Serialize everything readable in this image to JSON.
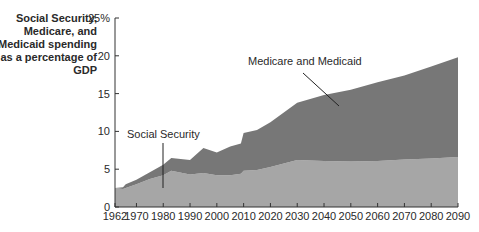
{
  "chart_data": {
    "type": "area",
    "stacked": true,
    "title": "",
    "ylabel": "Social Security, Medicare, and Medicaid spending as a percentage of GDP",
    "xlabel": "",
    "ylim": [
      0,
      25
    ],
    "xlim": [
      1962,
      2090
    ],
    "y_ticks": [
      "0",
      "5",
      "10",
      "15",
      "20",
      "25%"
    ],
    "x_ticks": [
      "1962",
      "1970",
      "1980",
      "1990",
      "2000",
      "2010",
      "2020",
      "2030",
      "2040",
      "2050",
      "2060",
      "2070",
      "2080",
      "2090"
    ],
    "grid": false,
    "legend": "none (direct annotations)",
    "x": [
      1962,
      1965,
      1966,
      1970,
      1975,
      1980,
      1983,
      1990,
      1995,
      2000,
      2005,
      2009,
      2010,
      2015,
      2020,
      2030,
      2040,
      2050,
      2060,
      2070,
      2080,
      2090
    ],
    "series": [
      {
        "name": "Social Security",
        "color": "#a6a6a6",
        "values": [
          2.5,
          2.4,
          2.5,
          3.0,
          3.7,
          4.2,
          4.8,
          4.3,
          4.5,
          4.2,
          4.2,
          4.4,
          4.8,
          4.9,
          5.3,
          6.2,
          6.1,
          6.0,
          6.1,
          6.3,
          6.4,
          6.6
        ]
      },
      {
        "name": "Medicare and Medicaid",
        "color": "#777777",
        "values": [
          0.0,
          0.2,
          0.5,
          0.6,
          0.9,
          1.4,
          1.7,
          1.9,
          3.3,
          3.0,
          3.8,
          4.0,
          5.0,
          5.3,
          5.9,
          7.6,
          8.7,
          9.5,
          10.4,
          11.1,
          12.2,
          13.2
        ]
      }
    ],
    "totals": [
      2.5,
      2.6,
      3.0,
      3.6,
      4.6,
      5.6,
      6.5,
      6.2,
      7.8,
      7.2,
      8.0,
      8.4,
      9.8,
      10.2,
      11.2,
      13.8,
      14.8,
      15.5,
      16.5,
      17.4,
      18.6,
      19.8
    ],
    "annotations": [
      {
        "text": "Social Security",
        "points_to_year": 1980
      },
      {
        "text": "Medicare and Medicaid",
        "points_to_year": 2037
      }
    ]
  },
  "labels": {
    "ylabel": "Social Security, Medicare, and Medicaid spending as a percentage of GDP",
    "annot_ss": "Social Security",
    "annot_mm": "Medicare and Medicaid"
  }
}
